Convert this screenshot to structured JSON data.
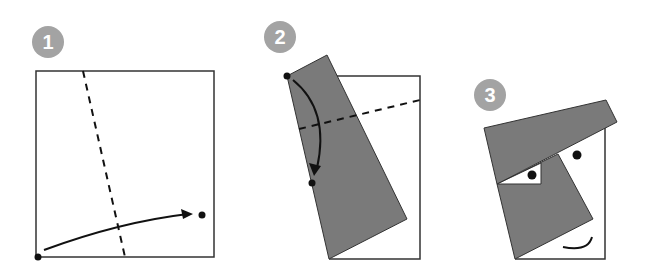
{
  "colors": {
    "badge": "#a3a3a3",
    "paper_folded": "#7a7a7a",
    "outline": "#333333",
    "line": "#111111",
    "background": "#ffffff"
  },
  "steps": [
    {
      "number": "1",
      "description": "Fold bottom-left corner to marked dot along dashed line"
    },
    {
      "number": "2",
      "description": "Fold top point down to marked dot along dashed line"
    },
    {
      "number": "3",
      "description": "Finished face with hat, eyes, nose and smile"
    }
  ]
}
